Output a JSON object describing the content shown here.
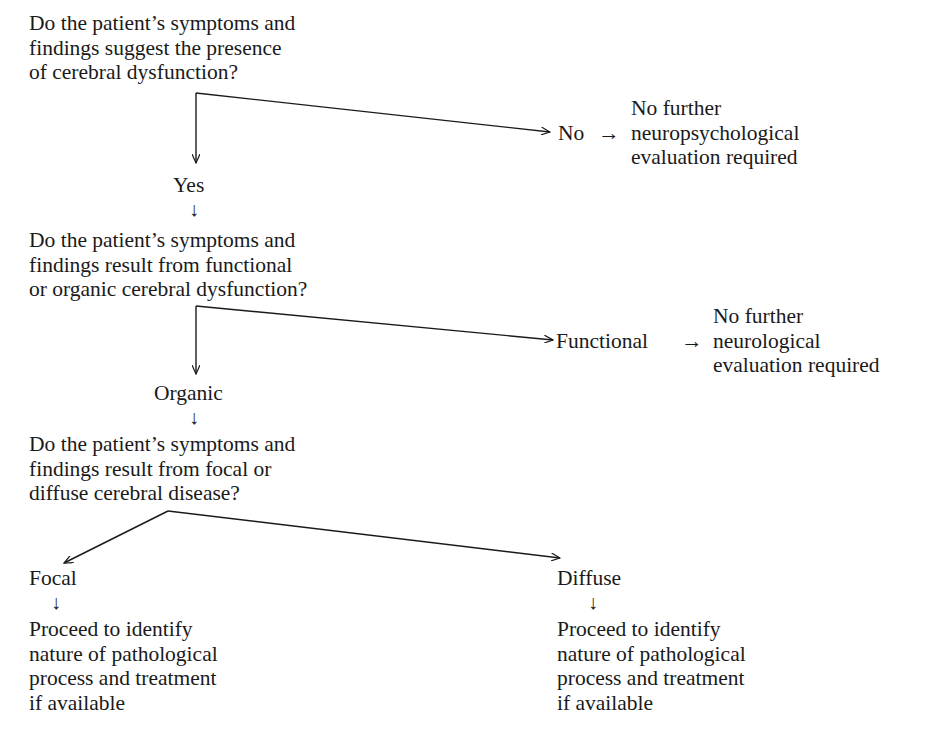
{
  "diagram": {
    "type": "flowchart",
    "questions": [
      {
        "id": "q1",
        "lines": [
          "Do the patient’s symptoms and",
          "findings suggest the presence",
          "of cerebral dysfunction?"
        ]
      },
      {
        "id": "q2",
        "lines": [
          "Do the patient’s symptoms and",
          "findings result from functional",
          "or organic cerebral dysfunction?"
        ]
      },
      {
        "id": "q3",
        "lines": [
          "Do the patient’s symptoms and",
          "findings result from focal or",
          "diffuse cerebral disease?"
        ]
      }
    ],
    "branches": {
      "yes": "Yes",
      "no": "No",
      "no_arrow": "→",
      "no_outcome": [
        "No further",
        "neuropsychological",
        "evaluation required"
      ],
      "organic": "Organic",
      "functional": "Functional",
      "functional_arrow": "→",
      "functional_outcome": [
        "No further",
        "neurological",
        "evaluation required"
      ],
      "focal": "Focal",
      "diffuse": "Diffuse",
      "focal_outcome": [
        "Proceed to identify",
        "nature of pathological",
        "process and treatment",
        "if available"
      ],
      "diffuse_outcome": [
        "Proceed to identify",
        "nature of pathological",
        "process and treatment",
        "if available"
      ]
    },
    "down_arrow_glyph": "↓"
  }
}
